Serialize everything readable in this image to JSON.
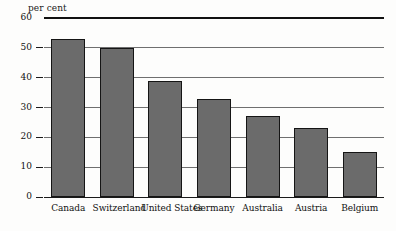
{
  "chart_data": {
    "type": "bar",
    "title": "",
    "subtitle": "",
    "xlabel": "",
    "ylabel": "per cent",
    "unit_label": "per cent",
    "categories": [
      "Canada",
      "Switzerland",
      "United States",
      "Germany",
      "Australia",
      "Austria",
      "Belgium"
    ],
    "values": [
      53,
      50,
      39,
      33,
      27,
      23,
      15
    ],
    "ylim": [
      0,
      60
    ],
    "ytick_values": [
      0,
      10,
      20,
      30,
      40,
      50,
      60
    ],
    "ytick_labels": [
      "0",
      "10",
      "20",
      "30",
      "40",
      "50",
      "60"
    ],
    "grid": true,
    "grid_axis": "y",
    "legend": false,
    "legend_position": "none",
    "bar_color": "#6b6b6b",
    "bar_edge_color": "#151515",
    "gridline_color": "#6f6f6f",
    "top_rule_color": "#111111",
    "axis_color": "#1a1a1a",
    "background_color": "#fdfdfc",
    "text_color": "#111111"
  }
}
